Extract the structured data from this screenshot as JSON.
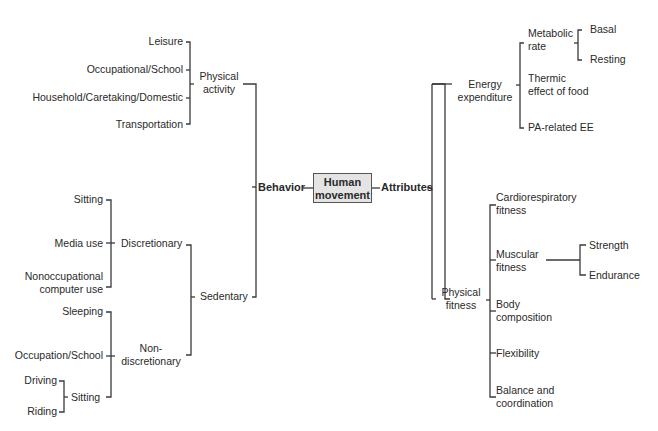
{
  "diagram": {
    "root": {
      "line1": "Human",
      "line2": "movement"
    },
    "behavior": {
      "label": "Behavior",
      "physical_activity": {
        "label_line1": "Physical",
        "label_line2": "activity",
        "children": [
          "Leisure",
          "Occupational/School",
          "Household/Caretaking/Domestic",
          "Transportation"
        ]
      },
      "sedentary": {
        "label": "Sedentary",
        "discretionary": {
          "label": "Discretionary",
          "children": [
            "Sitting",
            "Media use",
            "Nonoccupational",
            "computer use"
          ]
        },
        "nondiscretionary": {
          "label_line1": "Non-",
          "label_line2": "discretionary",
          "children": [
            "Sleeping",
            "Occupation/School"
          ],
          "sitting": {
            "label": "Sitting",
            "children": [
              "Driving",
              "Riding"
            ]
          }
        }
      }
    },
    "attributes": {
      "label": "Attributes",
      "energy_expenditure": {
        "label_line1": "Energy",
        "label_line2": "expenditure",
        "metabolic_rate": {
          "line1": "Metabolic",
          "line2": "rate",
          "children": [
            "Basal",
            "Resting"
          ]
        },
        "thermic": {
          "line1": "Thermic",
          "line2": "effect of food"
        },
        "pa_ee": "PA-related EE"
      },
      "physical_fitness": {
        "label_line1": "Physical",
        "label_line2": "fitness",
        "cardio": {
          "line1": "Cardiorespiratory",
          "line2": "fitness"
        },
        "muscular": {
          "line1": "Muscular",
          "line2": "fitness",
          "children": [
            "Strength",
            "Endurance"
          ]
        },
        "body": {
          "line1": "Body",
          "line2": "composition"
        },
        "flexibility": "Flexibility",
        "balance": {
          "line1": "Balance and",
          "line2": "coordination"
        }
      }
    }
  }
}
